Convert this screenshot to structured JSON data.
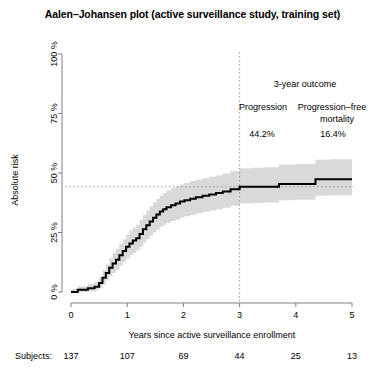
{
  "chart_data": {
    "type": "line",
    "title": "Aalen–Johansen plot (active surveillance study, training set)",
    "xlabel": "Years since active surveillance enrollment",
    "ylabel": "Absolute risk",
    "xlim": [
      0,
      5
    ],
    "ylim": [
      0,
      100
    ],
    "xticks": [
      0,
      1,
      2,
      3,
      4,
      5
    ],
    "xtick_labels": [
      "0",
      "1",
      "2",
      "3",
      "4",
      "5"
    ],
    "yticks": [
      0,
      25,
      50,
      75,
      100
    ],
    "ytick_labels": [
      "0 %",
      "25 %",
      "50 %",
      "75 %",
      "100 %"
    ],
    "grid": false,
    "legend": "none",
    "series": [
      {
        "name": "Cumulative incidence of progression",
        "style": "step",
        "color": "#000000",
        "x": [
          0,
          0.12,
          0.3,
          0.42,
          0.5,
          0.56,
          0.62,
          0.68,
          0.74,
          0.8,
          0.86,
          0.92,
          0.98,
          1.04,
          1.1,
          1.16,
          1.22,
          1.28,
          1.34,
          1.4,
          1.46,
          1.52,
          1.58,
          1.64,
          1.7,
          1.78,
          1.86,
          1.94,
          2.02,
          2.12,
          2.22,
          2.34,
          2.46,
          2.58,
          2.7,
          2.84,
          3.0,
          3.2,
          3.42,
          3.7,
          4.0,
          4.35,
          4.6,
          5.0
        ],
        "y": [
          0.0,
          0.9,
          1.6,
          2.2,
          3.8,
          6.0,
          8.0,
          10.2,
          12.0,
          13.6,
          15.4,
          17.2,
          19.0,
          20.4,
          21.6,
          22.6,
          24.4,
          26.4,
          28.0,
          29.6,
          31.2,
          32.6,
          33.8,
          34.8,
          35.6,
          36.4,
          37.2,
          38.0,
          38.6,
          39.2,
          39.8,
          40.4,
          41.0,
          41.6,
          42.2,
          43.2,
          44.2,
          44.2,
          44.2,
          45.4,
          45.4,
          47.4,
          47.4,
          47.4
        ]
      },
      {
        "name": "95% confidence band (upper)",
        "style": "band-upper",
        "color": "#d9d9d9",
        "x": [
          0,
          0.12,
          0.3,
          0.42,
          0.5,
          0.56,
          0.62,
          0.68,
          0.74,
          0.8,
          0.86,
          0.92,
          0.98,
          1.04,
          1.1,
          1.16,
          1.22,
          1.28,
          1.34,
          1.4,
          1.46,
          1.52,
          1.58,
          1.64,
          1.7,
          1.78,
          1.86,
          1.94,
          2.02,
          2.12,
          2.22,
          2.34,
          2.46,
          2.58,
          2.7,
          2.84,
          3.0,
          3.2,
          3.42,
          3.7,
          4.0,
          4.35,
          4.6,
          5.0
        ],
        "y": [
          1.2,
          2.4,
          3.6,
          4.4,
          6.4,
          9.2,
          11.6,
          14.2,
          16.4,
          18.2,
          20.2,
          22.2,
          24.2,
          25.8,
          27.0,
          28.2,
          30.2,
          32.4,
          34.2,
          36.0,
          37.6,
          39.2,
          40.4,
          41.6,
          42.6,
          43.6,
          44.4,
          45.2,
          45.8,
          46.6,
          47.2,
          47.8,
          48.4,
          49.0,
          49.8,
          50.8,
          52.0,
          52.2,
          52.4,
          53.6,
          53.8,
          55.6,
          55.8,
          56.0
        ]
      },
      {
        "name": "95% confidence band (lower)",
        "style": "band-lower",
        "color": "#d9d9d9",
        "x": [
          0,
          0.12,
          0.3,
          0.42,
          0.5,
          0.56,
          0.62,
          0.68,
          0.74,
          0.8,
          0.86,
          0.92,
          0.98,
          1.04,
          1.1,
          1.16,
          1.22,
          1.28,
          1.34,
          1.4,
          1.46,
          1.52,
          1.58,
          1.64,
          1.7,
          1.78,
          1.86,
          1.94,
          2.02,
          2.12,
          2.22,
          2.34,
          2.46,
          2.58,
          2.7,
          2.84,
          3.0,
          3.2,
          3.42,
          3.7,
          4.0,
          4.35,
          4.6,
          5.0
        ],
        "y": [
          0.0,
          0.0,
          0.2,
          0.6,
          1.6,
          3.2,
          4.8,
          6.6,
          8.0,
          9.4,
          11.0,
          12.6,
          14.2,
          15.4,
          16.4,
          17.4,
          19.0,
          20.8,
          22.2,
          23.6,
          25.0,
          26.2,
          27.4,
          28.2,
          29.0,
          29.8,
          30.4,
          31.2,
          31.8,
          32.4,
          33.0,
          33.6,
          34.2,
          34.8,
          35.4,
          36.2,
          37.2,
          37.4,
          37.6,
          38.6,
          38.8,
          40.4,
          40.6,
          40.8
        ]
      }
    ],
    "reference_lines": [
      {
        "name": "vertical-3-year",
        "orientation": "vertical",
        "value": 3,
        "style": "dotted"
      },
      {
        "name": "horizontal-risk",
        "orientation": "horizontal",
        "value": 44.2,
        "style": "dotted"
      }
    ],
    "annotations": {
      "heading": "3-year outcome",
      "col1_label": "Progression",
      "col1_value": "44.2%",
      "col2_label_line1": "Progression–free",
      "col2_label_line2": "mortality",
      "col2_value": "16.4%"
    },
    "risk_table": {
      "row_label": "Subjects:",
      "values": [
        "137",
        "107",
        "69",
        "44",
        "25",
        "13"
      ]
    }
  },
  "colors": {
    "curve": "#000000",
    "band": "#d9d9d9",
    "axis": "#808080",
    "text": "#000000"
  }
}
